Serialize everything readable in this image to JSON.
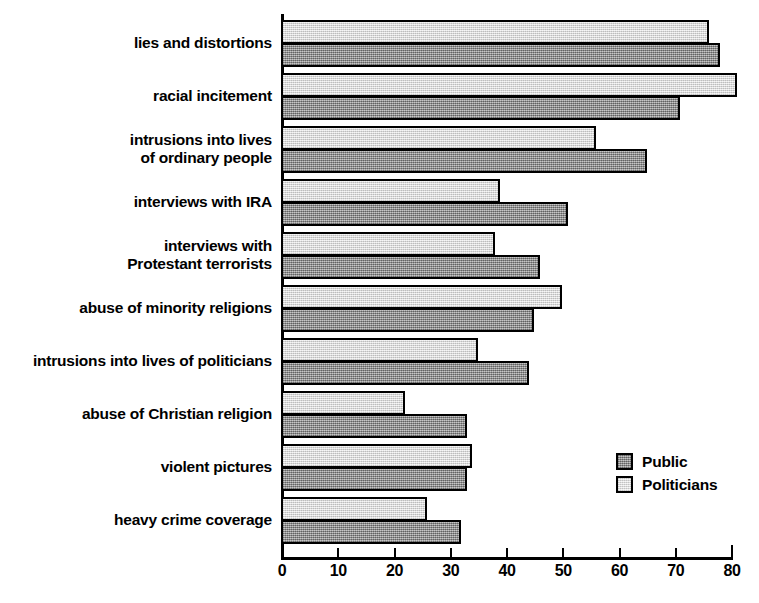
{
  "chart_data": {
    "type": "bar",
    "orientation": "horizontal",
    "title": "",
    "xlabel": "",
    "ylabel": "",
    "xlim": [
      0,
      80
    ],
    "xticks": [
      0,
      10,
      20,
      30,
      40,
      50,
      60,
      70,
      80
    ],
    "xtick_labels": [
      "0",
      "10",
      "20",
      "30",
      "40",
      "50",
      "60",
      "70",
      "80"
    ],
    "grid": false,
    "legend_position": "inner-right",
    "categories": [
      "lies and distortions",
      "racial incitement",
      "intrusions into lives\nof ordinary people",
      "interviews with IRA",
      "interviews with\nProtestant terrorists",
      "abuse of minority religions",
      "intrusions into lives of politicians",
      "abuse of Christian religion",
      "violent pictures",
      "heavy crime coverage"
    ],
    "series": [
      {
        "name": "Politicians",
        "color": "#e3e3e3",
        "values": [
          76,
          81,
          56,
          39,
          38,
          50,
          35,
          22,
          34,
          26
        ]
      },
      {
        "name": "Public",
        "color": "#9a9a9a",
        "values": [
          78,
          71,
          65,
          51,
          46,
          45,
          44,
          33,
          33,
          32
        ]
      }
    ]
  },
  "legend": {
    "items": [
      {
        "label": "Public",
        "swatch": "public"
      },
      {
        "label": "Politicians",
        "swatch": "politicians"
      }
    ]
  }
}
